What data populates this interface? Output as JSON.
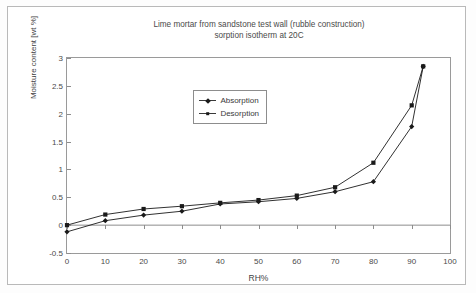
{
  "chart_data": {
    "type": "line",
    "title": "Lime mortar from sandstone test wall (rubble construction)\nsorption isotherm at 20C",
    "title_line1": "Lime mortar from sandstone test wall (rubble construction)",
    "title_line2": "sorption isotherm at 20C",
    "xlabel": "RH%",
    "ylabel": "Moisture content [wt %]",
    "xlim": [
      0,
      100
    ],
    "ylim": [
      -0.5,
      3
    ],
    "xticks": [
      0,
      10,
      20,
      30,
      40,
      50,
      60,
      70,
      80,
      90,
      100
    ],
    "xtick_labels": [
      "0",
      "10",
      "20",
      "30",
      "40",
      "50",
      "60",
      "70",
      "80",
      "90",
      "100"
    ],
    "yticks": [
      -0.5,
      0,
      0.5,
      1,
      1.5,
      2,
      2.5,
      3
    ],
    "ytick_labels": [
      "-0.5",
      "0",
      "0.5",
      "1",
      "1.5",
      "2",
      "2.5",
      "3"
    ],
    "grid": false,
    "legend_position": "upper-center-left",
    "series": [
      {
        "name": "Absorption",
        "marker": "diamond",
        "color": "#1a1a1a",
        "x": [
          0,
          10,
          20,
          30,
          40,
          50,
          60,
          70,
          80,
          90,
          93
        ],
        "y": [
          -0.12,
          0.08,
          0.18,
          0.25,
          0.38,
          0.42,
          0.48,
          0.6,
          0.78,
          1.77,
          2.85
        ]
      },
      {
        "name": "Desorption",
        "marker": "square",
        "color": "#1a1a1a",
        "x": [
          0,
          10,
          20,
          30,
          40,
          50,
          60,
          70,
          80,
          90,
          93
        ],
        "y": [
          0.0,
          0.19,
          0.29,
          0.34,
          0.4,
          0.45,
          0.53,
          0.68,
          1.12,
          2.15,
          2.85
        ]
      }
    ]
  }
}
